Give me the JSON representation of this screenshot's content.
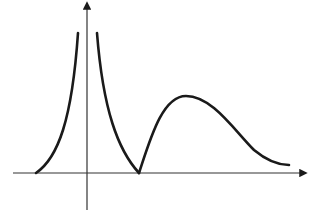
{
  "diagram": {
    "type": "function-sketch",
    "background": "#ffffff",
    "stroke_color": "#1a1a1a",
    "axis_color": "#333333",
    "x_axis": {
      "from": [
        13,
        173
      ],
      "to": [
        306,
        173
      ],
      "arrow": true
    },
    "y_axis": {
      "from": [
        87,
        210
      ],
      "to": [
        87,
        3
      ],
      "arrow": true
    },
    "curves": [
      {
        "name": "left-branch",
        "description": "rises from x-axis toward vertical asymptote left of y-axis",
        "path": "M36,173 C58,158 72,120 78,33"
      },
      {
        "name": "right-branch",
        "description": "descends from vertical asymptote right of y-axis to cusp on x-axis",
        "path": "M97,33 C103,110 118,150 139,173"
      },
      {
        "name": "hump",
        "description": "rises from cusp to a rounded peak then decays toward x-axis",
        "path": "M139,173 C150,140 162,96 186,96 C212,96 234,130 254,150 C266,160 278,165 289,165"
      }
    ]
  }
}
